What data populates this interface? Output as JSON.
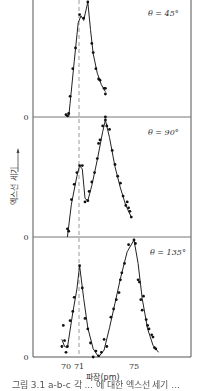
{
  "chart_data": {
    "type": "scatter",
    "title": "",
    "xlabel": "파장(pm)",
    "ylabel": "엑스선 세기",
    "x_ticks": [
      70,
      71,
      75
    ],
    "xlim": [
      69.2,
      77.4
    ],
    "reference_line_x": 71,
    "panels": [
      {
        "label": "θ = 45°",
        "y_zero_label": "0",
        "points": [
          [
            70.0,
            0.02
          ],
          [
            70.1,
            0.01
          ],
          [
            70.2,
            0.03
          ],
          [
            70.3,
            0.18
          ],
          [
            70.5,
            0.42
          ],
          [
            70.7,
            0.6
          ],
          [
            71.0,
            0.89
          ],
          [
            71.3,
            0.86
          ],
          [
            71.6,
            1.0
          ],
          [
            71.9,
            0.64
          ],
          [
            72.0,
            0.56
          ],
          [
            72.2,
            0.42
          ],
          [
            72.4,
            0.33
          ],
          [
            72.5,
            0.32
          ],
          [
            72.8,
            0.25
          ],
          [
            72.9,
            0.25
          ],
          [
            72.9,
            0.2
          ],
          [
            72.9,
            0.0
          ]
        ],
        "curve": [
          [
            70.2,
            0.0
          ],
          [
            70.3,
            0.12
          ],
          [
            70.6,
            0.48
          ],
          [
            70.9,
            0.82
          ],
          [
            71.1,
            0.88
          ],
          [
            71.3,
            0.84
          ],
          [
            71.6,
            1.0
          ],
          [
            71.8,
            0.76
          ],
          [
            72.0,
            0.55
          ],
          [
            72.3,
            0.38
          ],
          [
            72.6,
            0.28
          ],
          [
            72.9,
            0.22
          ]
        ]
      },
      {
        "label": "θ = 90°",
        "y_zero_label": "0",
        "points": [
          [
            70.1,
            0.07
          ],
          [
            70.2,
            0.05
          ],
          [
            70.4,
            0.32
          ],
          [
            70.6,
            0.45
          ],
          [
            70.8,
            0.55
          ],
          [
            71.0,
            0.61
          ],
          [
            71.2,
            0.61
          ],
          [
            71.4,
            0.3
          ],
          [
            71.6,
            0.31
          ],
          [
            71.7,
            0.39
          ],
          [
            71.9,
            0.47
          ],
          [
            72.1,
            0.55
          ],
          [
            72.3,
            0.67
          ],
          [
            72.4,
            0.8
          ],
          [
            72.5,
            0.83
          ],
          [
            72.7,
            0.95
          ],
          [
            72.9,
            1.0
          ],
          [
            73.0,
            0.95
          ],
          [
            73.2,
            0.92
          ],
          [
            73.4,
            0.74
          ],
          [
            73.6,
            0.62
          ],
          [
            73.8,
            0.52
          ],
          [
            74.0,
            0.46
          ],
          [
            74.2,
            0.35
          ],
          [
            74.4,
            0.27
          ],
          [
            74.5,
            0.3
          ],
          [
            74.6,
            0.25
          ],
          [
            74.7,
            0.22
          ],
          [
            74.8,
            0.17
          ]
        ],
        "curve": [
          [
            70.1,
            0.0
          ],
          [
            70.4,
            0.28
          ],
          [
            70.8,
            0.52
          ],
          [
            71.0,
            0.61
          ],
          [
            71.2,
            0.58
          ],
          [
            71.4,
            0.33
          ],
          [
            71.6,
            0.31
          ],
          [
            71.9,
            0.44
          ],
          [
            72.3,
            0.66
          ],
          [
            72.7,
            0.9
          ],
          [
            72.9,
            1.0
          ],
          [
            73.2,
            0.85
          ],
          [
            73.6,
            0.6
          ],
          [
            74.0,
            0.42
          ],
          [
            74.4,
            0.27
          ],
          [
            74.8,
            0.17
          ]
        ]
      },
      {
        "label": "θ = 135°",
        "y_zero_label": "0",
        "points": [
          [
            69.7,
            0.09
          ],
          [
            69.8,
            0.27
          ],
          [
            69.9,
            0.14
          ],
          [
            70.0,
            0.04
          ],
          [
            70.1,
            0.09
          ],
          [
            70.3,
            0.31
          ],
          [
            70.5,
            0.39
          ],
          [
            70.6,
            0.51
          ],
          [
            71.0,
            0.78
          ],
          [
            71.2,
            0.59
          ],
          [
            71.4,
            0.33
          ],
          [
            71.6,
            0.24
          ],
          [
            71.8,
            0.12
          ],
          [
            72.0,
            0.0
          ],
          [
            72.2,
            0.05
          ],
          [
            72.4,
            0.01
          ],
          [
            72.6,
            0.04
          ],
          [
            72.8,
            0.15
          ],
          [
            73.0,
            0.09
          ],
          [
            73.3,
            0.34
          ],
          [
            73.5,
            0.41
          ],
          [
            73.7,
            0.49
          ],
          [
            73.9,
            0.55
          ],
          [
            74.0,
            0.66
          ],
          [
            74.1,
            0.72
          ],
          [
            74.3,
            0.8
          ],
          [
            74.6,
            0.96
          ],
          [
            75.0,
            1.0
          ],
          [
            75.1,
            0.97
          ],
          [
            75.3,
            0.66
          ],
          [
            75.4,
            0.64
          ],
          [
            75.5,
            0.49
          ],
          [
            75.6,
            0.4
          ],
          [
            75.7,
            0.52
          ],
          [
            75.9,
            0.32
          ],
          [
            76.0,
            0.27
          ],
          [
            76.1,
            0.24
          ],
          [
            76.3,
            0.19
          ],
          [
            76.4,
            0.17
          ],
          [
            76.5,
            0.08
          ],
          [
            76.6,
            0.07
          ]
        ],
        "curve": [
          [
            69.7,
            0.15
          ],
          [
            69.9,
            0.09
          ],
          [
            70.1,
            0.08
          ],
          [
            70.5,
            0.38
          ],
          [
            70.8,
            0.58
          ],
          [
            71.0,
            0.78
          ],
          [
            71.3,
            0.5
          ],
          [
            71.6,
            0.25
          ],
          [
            72.0,
            0.07
          ],
          [
            72.4,
            0.0
          ],
          [
            72.8,
            0.06
          ],
          [
            73.2,
            0.25
          ],
          [
            73.6,
            0.46
          ],
          [
            74.0,
            0.67
          ],
          [
            74.5,
            0.9
          ],
          [
            75.0,
            1.0
          ],
          [
            75.3,
            0.8
          ],
          [
            75.6,
            0.5
          ],
          [
            76.0,
            0.24
          ],
          [
            76.4,
            0.1
          ],
          [
            76.8,
            0.04
          ]
        ]
      }
    ],
    "grid": false,
    "legend": "none"
  },
  "axes": {
    "x_tick_labels": [
      "70",
      "71",
      "75"
    ],
    "xlabel": "파장(pm)",
    "ylabel": "엑스선 세기",
    "zero_labels": [
      "0",
      "0",
      "0"
    ]
  },
  "panels": {
    "p1": {
      "label": "θ = 45°"
    },
    "p2": {
      "label": "θ = 90°"
    },
    "p3": {
      "label": "θ = 135°"
    }
  },
  "caption": "그림 3.1 a-b-c 각 ... 에 대한 엑스선 세기 ..."
}
